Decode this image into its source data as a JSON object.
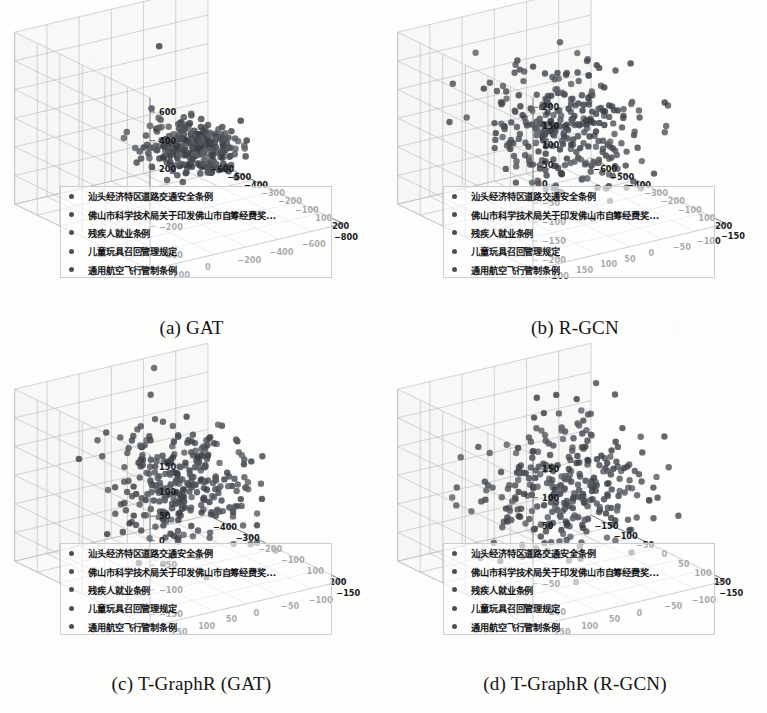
{
  "figure": {
    "panels": [
      {
        "id": "a",
        "caption": "(a) GAT",
        "zticks": [
          "600",
          "400",
          "200",
          "0",
          "-200",
          "-400"
        ],
        "xticks": [
          "-600",
          "-500",
          "-400",
          "-300",
          "-200",
          "-100",
          "100",
          "200"
        ],
        "yticks": [
          "200",
          "0",
          "-200",
          "-400",
          "-600",
          "-800"
        ]
      },
      {
        "id": "b",
        "caption": "(b) R-GCN",
        "zticks": [
          "200",
          "150",
          "100",
          "50",
          "0",
          "-50",
          "-100",
          "-150",
          "-200"
        ],
        "xticks": [
          "-600",
          "-500",
          "-400",
          "-300",
          "-200",
          "-100",
          "100",
          "200"
        ],
        "yticks": [
          "200",
          "150",
          "100",
          "50",
          "0",
          "-50",
          "-100",
          "-150"
        ]
      },
      {
        "id": "c",
        "caption": "(c) T-GraphR (GAT)",
        "zticks": [
          "150",
          "100",
          "50",
          "0",
          "-50",
          "-100",
          "-150"
        ],
        "xticks": [
          "-400",
          "-300",
          "-200",
          "-100",
          "100",
          "200"
        ],
        "yticks": [
          "150",
          "100",
          "50",
          "0",
          "-50",
          "-100",
          "-150"
        ]
      },
      {
        "id": "d",
        "caption": "(d) T-GraphR (R-GCN)",
        "zticks": [
          "150",
          "100",
          "50",
          "0",
          "-50",
          "-100"
        ],
        "xticks": [
          "-150",
          "-100",
          "-50",
          "0",
          "50",
          "100",
          "150"
        ],
        "yticks": [
          "150",
          "100",
          "50",
          "0",
          "-50",
          "-100",
          "-150"
        ]
      }
    ],
    "legend": {
      "items": [
        "汕头经济特区道路交通安全条例",
        "佛山市科学技术局关于印发佛山市自筹经费奖...",
        "残疾人就业条例",
        "儿童玩具召回管理规定",
        "通用航空飞行管制条例"
      ]
    },
    "colors": {
      "marker": "#4b4f55",
      "grid": "#b9bcc0",
      "axis": "#6f7276",
      "text": "#17191b",
      "pane": "#f4f4f3"
    }
  },
  "chart_data": [
    {
      "type": "scatter",
      "title": "(a) GAT",
      "projection": "3d",
      "xlabel": "",
      "ylabel": "",
      "zlabel": "",
      "grid": true,
      "legend_position": "lower-left-inside",
      "xlim": [
        -650,
        250
      ],
      "ylim": [
        -850,
        250
      ],
      "zlim": [
        -480,
        650
      ],
      "xticks": [
        -600,
        -500,
        -400,
        -300,
        -200,
        -100,
        100,
        200
      ],
      "yticks": [
        200,
        0,
        -200,
        -400,
        -600,
        -800
      ],
      "zticks": [
        600,
        400,
        200,
        0,
        -200,
        -400
      ],
      "series": [
        {
          "name": "汕头经济特区道路交通安全条例",
          "description": "dense tight cluster right-of-centre, ~260 points, roughly x 40..230, y -330..-60, z -230..110"
        },
        {
          "name": "佛山市科学技术局关于印发佛山市自筹经费奖...",
          "description": "co-located with main cluster"
        },
        {
          "name": "残疾人就业条例",
          "description": "co-located with main cluster"
        },
        {
          "name": "儿童玩具召回管理规定",
          "description": "co-located with main cluster"
        },
        {
          "name": "通用航空飞行管制条例",
          "description": "a handful of far outliers, one near z=560, a few at left of pane"
        }
      ],
      "n_points_approx": 270,
      "cluster_shape": "single compact ellipsoid plus ~6 scattered outliers"
    },
    {
      "type": "scatter",
      "title": "(b) R-GCN",
      "projection": "3d",
      "grid": true,
      "legend_position": "lower-left-inside",
      "xlim": [
        -650,
        250
      ],
      "ylim": [
        -160,
        210
      ],
      "zlim": [
        -210,
        215
      ],
      "xticks": [
        -600,
        -500,
        -400,
        -300,
        -200,
        -100,
        100,
        200
      ],
      "yticks": [
        200,
        150,
        100,
        50,
        0,
        -50,
        -100,
        -150
      ],
      "zticks": [
        200,
        150,
        100,
        50,
        0,
        -50,
        -100,
        -150,
        -200
      ],
      "n_points_approx": 300,
      "cluster_shape": "broad diffuse cloud filling most of the pane, slightly denser in lower centre"
    },
    {
      "type": "scatter",
      "title": "(c) T-GraphR (GAT)",
      "projection": "3d",
      "grid": true,
      "legend_position": "lower-left-inside",
      "xlim": [
        -420,
        230
      ],
      "ylim": [
        -160,
        160
      ],
      "zlim": [
        -170,
        165
      ],
      "xticks": [
        -400,
        -300,
        -200,
        -100,
        100,
        200
      ],
      "yticks": [
        150,
        100,
        50,
        0,
        -50,
        -100,
        -150
      ],
      "zticks": [
        150,
        100,
        50,
        0,
        -50,
        -100,
        -150
      ],
      "n_points_approx": 300,
      "cluster_shape": "roughly spherical central cloud with two far-left outliers"
    },
    {
      "type": "scatter",
      "title": "(d) T-GraphR (R-GCN)",
      "projection": "3d",
      "grid": true,
      "legend_position": "lower-left-inside",
      "xlim": [
        -160,
        160
      ],
      "ylim": [
        -160,
        160
      ],
      "zlim": [
        -130,
        165
      ],
      "xticks": [
        -150,
        -100,
        -50,
        0,
        50,
        100,
        150
      ],
      "yticks": [
        150,
        100,
        50,
        0,
        -50,
        -100,
        -150
      ],
      "zticks": [
        150,
        100,
        50,
        0,
        -50,
        -100
      ],
      "n_points_approx": 300,
      "cluster_shape": "wide evenly spread cloud filling the full pane"
    }
  ]
}
